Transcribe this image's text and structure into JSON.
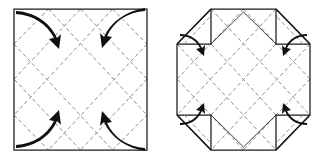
{
  "figure": {
    "type": "paper-folding-instruction",
    "panel_count": 2,
    "background_color": "#ffffff",
    "line_colors": {
      "outline": "#1b1b1b",
      "crease": "#8a8a8a",
      "arrow": "#101010"
    }
  },
  "panels": [
    {
      "id": "panel-left",
      "name": "square-with-diagonal-grid",
      "shape": "square",
      "label": "",
      "outline": {
        "x": 14,
        "y": 9,
        "width": 133,
        "height": 141,
        "points": "14,9 147,9 147,150 14,150"
      },
      "creases": [
        {
          "name": "diagonal-crease-1",
          "style": "dashed",
          "points": "14,79 80,9"
        },
        {
          "name": "diagonal-crease-2",
          "style": "dashed",
          "points": "14,79 80,150"
        },
        {
          "name": "diagonal-crease-3",
          "style": "dashed",
          "points": "147,79 80,9"
        },
        {
          "name": "diagonal-crease-4",
          "style": "dashed",
          "points": "147,79 80,150"
        },
        {
          "name": "corner-crease-top-left",
          "style": "dashed",
          "points": "14,44 48,9"
        },
        {
          "name": "corner-crease-top-right",
          "style": "dashed",
          "points": "113,9 147,44"
        },
        {
          "name": "corner-crease-bottom-left",
          "style": "dashed",
          "points": "14,115 48,150"
        },
        {
          "name": "corner-crease-bottom-right",
          "style": "dashed",
          "points": "113,150 147,115"
        },
        {
          "name": "inner-diagonal-a",
          "style": "dashed",
          "points": "48,9 147,115"
        },
        {
          "name": "inner-diagonal-b",
          "style": "dashed",
          "points": "14,44 113,150"
        },
        {
          "name": "inner-diagonal-c",
          "style": "dashed",
          "points": "113,9 14,115"
        },
        {
          "name": "inner-diagonal-d",
          "style": "dashed",
          "points": "147,44 48,150"
        }
      ],
      "arrows": [
        {
          "name": "fold-arrow-top-left",
          "direction": "corner-to-center",
          "corner": "top-left"
        },
        {
          "name": "fold-arrow-top-right",
          "direction": "corner-to-center",
          "corner": "top-right"
        },
        {
          "name": "fold-arrow-bottom-left",
          "direction": "corner-to-center",
          "corner": "bottom-left"
        },
        {
          "name": "fold-arrow-bottom-right",
          "direction": "corner-to-center",
          "corner": "bottom-right"
        }
      ]
    },
    {
      "id": "panel-right",
      "name": "octagon-with-folded-corners",
      "shape": "octagon",
      "label": "",
      "outline": {
        "x": 177,
        "y": 9,
        "width": 133,
        "height": 141,
        "points": "211,9 276,9 310,44 310,115 276,150 211,150 177,115 177,44"
      },
      "creases": [
        {
          "name": "octagon-diagonal-1",
          "style": "dashed",
          "points": "177,79 243,9"
        },
        {
          "name": "octagon-diagonal-2",
          "style": "dashed",
          "points": "177,79 243,150"
        },
        {
          "name": "octagon-diagonal-3",
          "style": "dashed",
          "points": "310,79 243,9"
        },
        {
          "name": "octagon-diagonal-4",
          "style": "dashed",
          "points": "310,79 243,150"
        }
      ],
      "flaps": [
        {
          "name": "corner-flap-top-left",
          "corner": "top-left"
        },
        {
          "name": "corner-flap-top-right",
          "corner": "top-right"
        },
        {
          "name": "corner-flap-bottom-left",
          "corner": "bottom-left"
        },
        {
          "name": "corner-flap-bottom-right",
          "corner": "bottom-right"
        }
      ],
      "arrows": [
        {
          "name": "flap-arrow-top-left",
          "direction": "inward",
          "corner": "top-left"
        },
        {
          "name": "flap-arrow-top-right",
          "direction": "inward",
          "corner": "top-right"
        },
        {
          "name": "flap-arrow-bottom-left",
          "direction": "inward",
          "corner": "bottom-left"
        },
        {
          "name": "flap-arrow-bottom-right",
          "direction": "inward",
          "corner": "bottom-right"
        }
      ]
    }
  ]
}
